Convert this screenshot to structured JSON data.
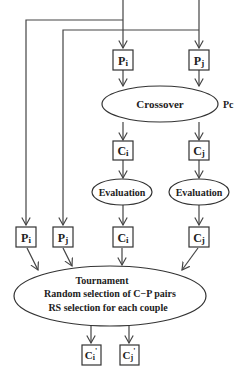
{
  "diagram": {
    "top_parents": {
      "pi": {
        "main": "P",
        "sub": "i"
      },
      "pj": {
        "main": "P",
        "sub": "j"
      }
    },
    "crossover": {
      "label": "Crossover",
      "param": "Pc"
    },
    "children": {
      "ci": {
        "main": "C",
        "sub": "i"
      },
      "cj": {
        "main": "C",
        "sub": "j"
      }
    },
    "evaluation": {
      "left": "Evaluation",
      "right": "Evaluation"
    },
    "evaluated_children": {
      "ci": {
        "main": "C",
        "sub": "i"
      },
      "cj": {
        "main": "C",
        "sub": "j"
      }
    },
    "side_parents": {
      "pi": {
        "main": "P",
        "sub": "i"
      },
      "pj": {
        "main": "P",
        "sub": "j"
      }
    },
    "tournament": {
      "line1": "Tournament",
      "line2": "Random selection of C−P pairs",
      "line3": "RS selection for each couple"
    },
    "outputs": {
      "ci": {
        "main": "C",
        "sub": "i",
        "prime": "'"
      },
      "cj": {
        "main": "C",
        "sub": "j",
        "prime": "'"
      }
    },
    "colors": {
      "stroke": "#333333",
      "text": "#222222",
      "background": "#ffffff"
    }
  }
}
